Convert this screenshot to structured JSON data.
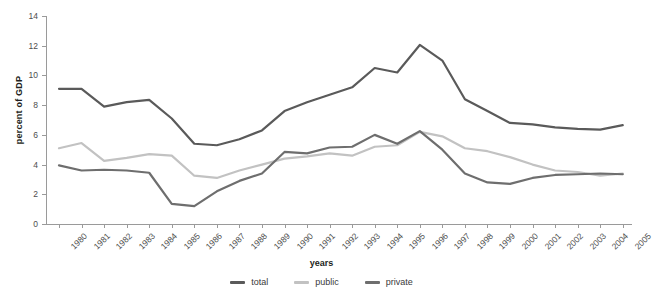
{
  "chart_data": {
    "type": "line",
    "title": "",
    "xlabel": "years",
    "ylabel": "percent of GDP",
    "xlim": [
      1980,
      2005
    ],
    "ylim": [
      0,
      14
    ],
    "yticks": [
      0,
      2,
      4,
      6,
      8,
      10,
      12,
      14
    ],
    "grid": false,
    "legend_position": "bottom-center",
    "categories": [
      "1980",
      "1981",
      "1982",
      "1983",
      "1984",
      "1985",
      "1986",
      "1987",
      "1988",
      "1989",
      "1990",
      "1991",
      "1992",
      "1993",
      "1994",
      "1995",
      "1996",
      "1997",
      "1998",
      "1999",
      "2000",
      "2001",
      "2002",
      "2003",
      "2004",
      "2005"
    ],
    "series": [
      {
        "name": "total",
        "color": "#5a5a5a",
        "values": [
          9.1,
          9.1,
          7.9,
          8.2,
          8.35,
          7.1,
          5.4,
          5.3,
          5.7,
          6.3,
          7.6,
          8.2,
          8.7,
          9.2,
          10.5,
          10.2,
          12.05,
          11.0,
          8.4,
          7.6,
          6.8,
          6.7,
          6.5,
          6.4,
          6.35,
          6.65
        ]
      },
      {
        "name": "public",
        "color": "#c2c2c2",
        "values": [
          5.1,
          5.45,
          4.25,
          4.45,
          4.7,
          4.6,
          3.25,
          3.1,
          3.6,
          4.0,
          4.4,
          4.55,
          4.75,
          4.6,
          5.2,
          5.3,
          6.2,
          5.9,
          5.1,
          4.9,
          4.5,
          4.0,
          3.6,
          3.5,
          3.25,
          3.4
        ]
      },
      {
        "name": "private",
        "color": "#6e6e6e",
        "values": [
          3.95,
          3.6,
          3.65,
          3.6,
          3.45,
          1.35,
          1.2,
          2.2,
          2.9,
          3.4,
          4.85,
          4.75,
          5.15,
          5.2,
          6.0,
          5.4,
          6.25,
          5.0,
          3.4,
          2.8,
          2.7,
          3.1,
          3.3,
          3.35,
          3.4,
          3.35
        ]
      }
    ]
  },
  "legend": {
    "items": [
      {
        "label": "total"
      },
      {
        "label": "public"
      },
      {
        "label": "private"
      }
    ]
  }
}
